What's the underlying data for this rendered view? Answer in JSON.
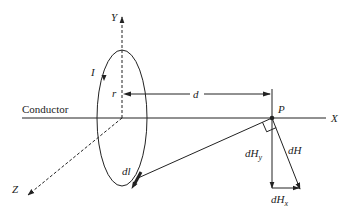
{
  "diagram": {
    "title": "",
    "labels": {
      "y_axis": "Y",
      "x_axis": "X",
      "z_axis": "Z",
      "current": "I",
      "radius": "r",
      "distance": "d",
      "point": "P",
      "conductor": "Conductor",
      "element": "dl",
      "field": "dH",
      "field_y": "dH",
      "field_y_sub": "y",
      "field_x": "dH",
      "field_x_sub": "x"
    },
    "colors": {
      "stroke": "#222222",
      "background": "#ffffff"
    }
  }
}
